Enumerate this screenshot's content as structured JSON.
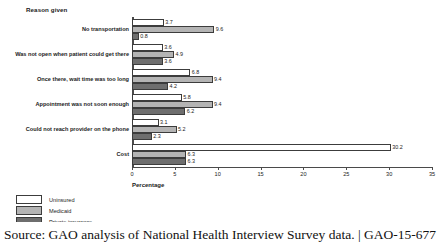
{
  "figure": {
    "y_axis_title": "Reason given",
    "x_axis_title": "Percentage"
  },
  "legend": {
    "items": [
      {
        "label": "Uninsured",
        "key": "uninsured",
        "color": "#ffffff"
      },
      {
        "label": "Medicaid",
        "key": "medicaid",
        "color": "#b4b4b4"
      },
      {
        "label": "Private insurance",
        "key": "private",
        "color": "#6e6e6e"
      }
    ]
  },
  "caption": {
    "text": "Source: GAO analysis of National Health Interview Survey data. | GAO-15-677"
  },
  "chart_data": {
    "type": "bar",
    "orientation": "horizontal",
    "title": "",
    "xlabel": "Percentage",
    "ylabel": "Reason given",
    "xlim": [
      0,
      35
    ],
    "xticks": [
      0,
      5,
      10,
      15,
      20,
      25,
      30,
      35
    ],
    "grid": false,
    "legend_position": "bottom-left",
    "categories": [
      "No transportation",
      "Was not open when patient could get there",
      "Once there, wait time was too long",
      "Appointment was not soon enough",
      "Could not reach provider on the phone",
      "Cost"
    ],
    "series": [
      {
        "name": "Uninsured",
        "values": [
          3.7,
          3.6,
          6.8,
          5.8,
          3.1,
          30.2
        ]
      },
      {
        "name": "Medicaid",
        "values": [
          9.6,
          4.9,
          9.4,
          9.4,
          5.2,
          6.3
        ]
      },
      {
        "name": "Private insurance",
        "values": [
          0.8,
          3.6,
          4.2,
          6.2,
          2.3,
          6.3
        ]
      }
    ]
  }
}
